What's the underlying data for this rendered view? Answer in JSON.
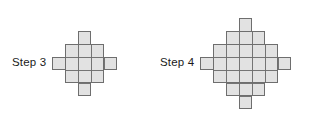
{
  "figures": [
    {
      "id": "step3",
      "label": "Step 3",
      "step_number": 3,
      "grid_width": 5,
      "grid_height": 5,
      "row_counts": [
        1,
        3,
        5,
        3,
        1
      ],
      "total_squares": 13,
      "cell_size_px": 13,
      "shape": "diamond",
      "bands": [
        {
          "name": "vertical-column",
          "col": 2,
          "row": 0,
          "cols": 1,
          "rows": 5
        },
        {
          "name": "horizontal-row",
          "col": 0,
          "row": 2,
          "cols": 5,
          "rows": 1
        },
        {
          "name": "center-block",
          "col": 1,
          "row": 1,
          "cols": 3,
          "rows": 3
        }
      ]
    },
    {
      "id": "step4",
      "label": "Step 4",
      "step_number": 4,
      "grid_width": 7,
      "grid_height": 7,
      "row_counts": [
        1,
        3,
        5,
        7,
        5,
        3,
        1
      ],
      "total_squares": 25,
      "cell_size_px": 13,
      "shape": "diamond",
      "bands": [
        {
          "name": "vertical-column",
          "col": 3,
          "row": 0,
          "cols": 1,
          "rows": 7
        },
        {
          "name": "horizontal-row",
          "col": 0,
          "row": 3,
          "cols": 7,
          "rows": 1
        },
        {
          "name": "inner-block-3",
          "col": 2,
          "row": 1,
          "cols": 3,
          "rows": 5
        },
        {
          "name": "inner-block-5",
          "col": 1,
          "row": 2,
          "cols": 5,
          "rows": 3
        }
      ]
    }
  ],
  "colors": {
    "square_fill": "#e2e2e2",
    "square_border": "#6e6e6e",
    "background": "#ffffff",
    "label_text": "#1a1a1a"
  }
}
